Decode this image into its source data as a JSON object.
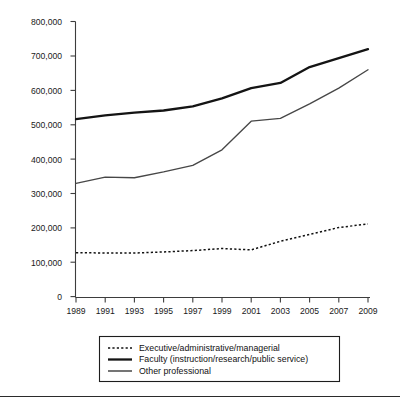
{
  "chart_data": {
    "type": "line",
    "title": "",
    "subtitle": "",
    "xlabel": "",
    "ylabel": "",
    "x": [
      1989,
      1991,
      1993,
      1995,
      1997,
      1999,
      2001,
      2003,
      2005,
      2007,
      2009
    ],
    "categories": [
      "1989",
      "1991",
      "1993",
      "1995",
      "1997",
      "1999",
      "2001",
      "2003",
      "2005",
      "2007",
      "2009"
    ],
    "xlim": [
      1989,
      2009
    ],
    "ylim": [
      0,
      800000
    ],
    "ytick_labels": [
      "0",
      "100,000",
      "200,000",
      "300,000",
      "400,000",
      "500,000",
      "600,000",
      "700,000",
      "800,000"
    ],
    "ytick_values": [
      0,
      100000,
      200000,
      300000,
      400000,
      500000,
      600000,
      700000,
      800000
    ],
    "grid": false,
    "legend_position": "bottom",
    "series": [
      {
        "name": "Executive/administrative/managerial",
        "style": "dotted",
        "color": "#111111",
        "values": [
          130000,
          129000,
          129000,
          132000,
          136000,
          142000,
          138000,
          163000,
          183000,
          203000,
          213000
        ]
      },
      {
        "name": "Faculty (instruction/research/public service)",
        "style": "solid-thick",
        "color": "#141414",
        "values": [
          517000,
          528000,
          536000,
          542000,
          554000,
          577000,
          607000,
          622000,
          668000,
          694000,
          720000
        ]
      },
      {
        "name": "Other professional",
        "style": "solid-thin",
        "color": "#474747",
        "values": [
          331000,
          349000,
          347000,
          364000,
          383000,
          428000,
          511000,
          519000,
          561000,
          607000,
          660000
        ]
      }
    ]
  },
  "legend": {
    "items": [
      {
        "label": "Executive/administrative/managerial",
        "swatch": "dotted-line-swatch"
      },
      {
        "label": "Faculty (instruction/research/public service)",
        "swatch": "thick-line-swatch"
      },
      {
        "label": "Other professional",
        "swatch": "thin-line-swatch"
      }
    ]
  }
}
